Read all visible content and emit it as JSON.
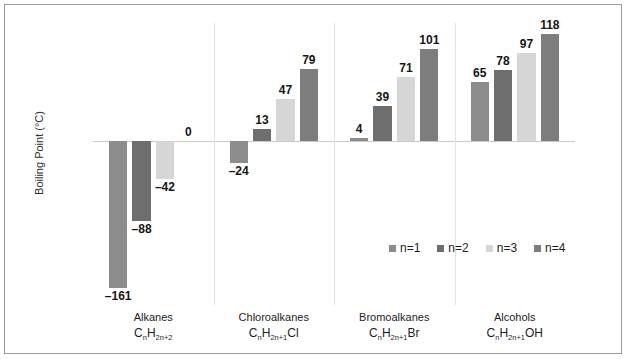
{
  "chart_data": {
    "type": "bar",
    "title": "",
    "xlabel": "",
    "ylabel": "Boiling Point (°C)",
    "ylim": [
      -180,
      130
    ],
    "grid": false,
    "legend_position": "inside-center",
    "categories": [
      "Alkanes",
      "Chloroalkanes",
      "Bromoalkanes",
      "Alcohols"
    ],
    "category_formulas": [
      "CnH2n+2",
      "CnH2n+1Cl",
      "CnH2n+1Br",
      "CnH2n+1OH"
    ],
    "series": [
      {
        "name": "n=1",
        "color": "#8c8c8c",
        "values": [
          -161,
          -24,
          4,
          65
        ]
      },
      {
        "name": "n=2",
        "color": "#6e6e6e",
        "values": [
          -88,
          13,
          39,
          78
        ]
      },
      {
        "name": "n=3",
        "color": "#d6d6d6",
        "values": [
          -42,
          47,
          71,
          97
        ]
      },
      {
        "name": "n=4",
        "color": "#7d7d7d",
        "values": [
          0,
          79,
          101,
          118
        ]
      }
    ],
    "data_labels": [
      [
        "–161",
        "–24",
        "4",
        "65"
      ],
      [
        "–88",
        "13",
        "39",
        "78"
      ],
      [
        "–42",
        "47",
        "71",
        "97"
      ],
      [
        "0",
        "79",
        "101",
        "118"
      ]
    ]
  },
  "axis": {
    "y_title": "Boiling Point (°C)"
  },
  "legend": {
    "items": [
      {
        "label": "n=1",
        "color": "#8c8c8c"
      },
      {
        "label": "n=2",
        "color": "#6e6e6e"
      },
      {
        "label": "n=3",
        "color": "#d6d6d6"
      },
      {
        "label": "n=4",
        "color": "#7d7d7d"
      }
    ]
  },
  "categories": [
    {
      "name": "Alkanes",
      "formula_pre": "C",
      "formula_sub1": "n",
      "formula_mid": "H",
      "formula_sub2": "2n+2",
      "formula_post": ""
    },
    {
      "name": "Chloroalkanes",
      "formula_pre": "C",
      "formula_sub1": "n",
      "formula_mid": "H",
      "formula_sub2": "2n+1",
      "formula_post": "Cl"
    },
    {
      "name": "Bromoalkanes",
      "formula_pre": "C",
      "formula_sub1": "n",
      "formula_mid": "H",
      "formula_sub2": "2n+1",
      "formula_post": "Br"
    },
    {
      "name": "Alcohols",
      "formula_pre": "C",
      "formula_sub1": "n",
      "formula_mid": "H",
      "formula_sub2": "2n+1",
      "formula_post": "OH"
    }
  ]
}
